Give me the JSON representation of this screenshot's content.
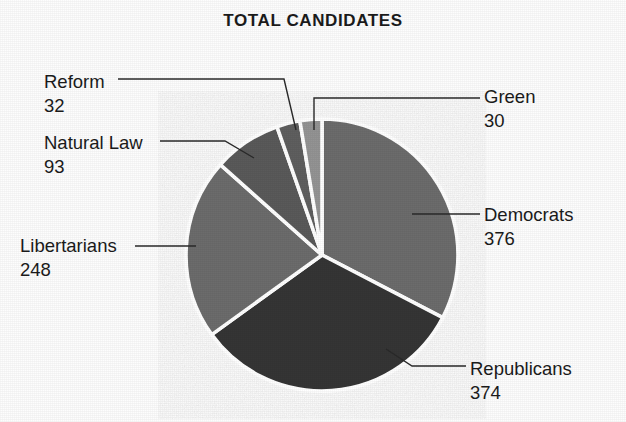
{
  "chart_data": {
    "type": "pie",
    "title": "TOTAL CANDIDATES",
    "xlabel": "",
    "ylabel": "",
    "total": 1153,
    "legend_position": "callout-labels",
    "grid": false,
    "categories": [
      "Democrats",
      "Republicans",
      "Libertarians",
      "Natural Law",
      "Reform",
      "Green"
    ],
    "values": [
      376,
      374,
      248,
      93,
      32,
      30
    ],
    "start_angle_deg": 0,
    "direction": "clockwise",
    "slices": [
      {
        "label": "Democrats",
        "value": 376,
        "percent": 32.6,
        "angle_deg": 117.4,
        "color": "#6c6c6c",
        "label_side": "right"
      },
      {
        "label": "Republicans",
        "value": 374,
        "percent": 32.4,
        "angle_deg": 116.8,
        "color": "#343434",
        "label_side": "right"
      },
      {
        "label": "Libertarians",
        "value": 248,
        "percent": 21.5,
        "angle_deg": 77.4,
        "color": "#6c6c6c",
        "label_side": "left"
      },
      {
        "label": "Natural Law",
        "value": 93,
        "percent": 8.1,
        "angle_deg": 29.0,
        "color": "#5a5a5a",
        "label_side": "left"
      },
      {
        "label": "Reform",
        "value": 32,
        "percent": 2.8,
        "angle_deg": 10.0,
        "color": "#5e5e5e",
        "label_side": "left"
      },
      {
        "label": "Green",
        "value": 30,
        "percent": 2.6,
        "angle_deg": 9.4,
        "color": "#949494",
        "label_side": "right"
      }
    ]
  },
  "labels": {
    "reform": {
      "name": "Reform",
      "value": "32"
    },
    "natural_law": {
      "name": "Natural Law",
      "value": "93"
    },
    "libertarians": {
      "name": "Libertarians",
      "value": "248"
    },
    "green": {
      "name": "Green",
      "value": "30"
    },
    "democrats": {
      "name": "Democrats",
      "value": "376"
    },
    "republicans": {
      "name": "Republicans",
      "value": "374"
    }
  },
  "colors": {
    "background": "#fdfdfd",
    "text": "#1b1b1b",
    "leader_line": "#2a2a2a",
    "slice_separator": "#ffffff",
    "slice_light": "#949494",
    "slice_medium": "#6c6c6c",
    "slice_dark": "#343434"
  }
}
